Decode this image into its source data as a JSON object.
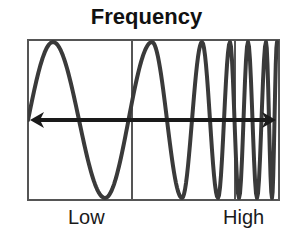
{
  "title": "Frequency",
  "labels": {
    "low": "Low",
    "high": "High"
  },
  "colors": {
    "frame": "#555555",
    "wave": "#3a3a3a",
    "arrow": "#1a1a1a",
    "background": "#ffffff"
  },
  "frame": {
    "x": 28,
    "y": 40,
    "width": 251,
    "height": 160,
    "dividers_x": [
      132,
      235
    ]
  },
  "axis_arrow": {
    "y": 120,
    "x_start": 30,
    "x_end": 276
  },
  "wave": {
    "mid_y": 120,
    "top_y": 42,
    "bottom_y": 198,
    "start_x": 28,
    "extrema": [
      {
        "x": 53,
        "type": "peak"
      },
      {
        "x": 105,
        "type": "trough"
      },
      {
        "x": 152,
        "type": "peak"
      },
      {
        "x": 182,
        "type": "trough"
      },
      {
        "x": 202,
        "type": "peak"
      },
      {
        "x": 218,
        "type": "trough"
      },
      {
        "x": 230,
        "type": "peak"
      },
      {
        "x": 239,
        "type": "trough"
      },
      {
        "x": 248,
        "type": "peak"
      },
      {
        "x": 257,
        "type": "trough"
      },
      {
        "x": 266,
        "type": "peak"
      },
      {
        "x": 272,
        "type": "trough"
      },
      {
        "x": 277,
        "type": "peak"
      }
    ]
  }
}
